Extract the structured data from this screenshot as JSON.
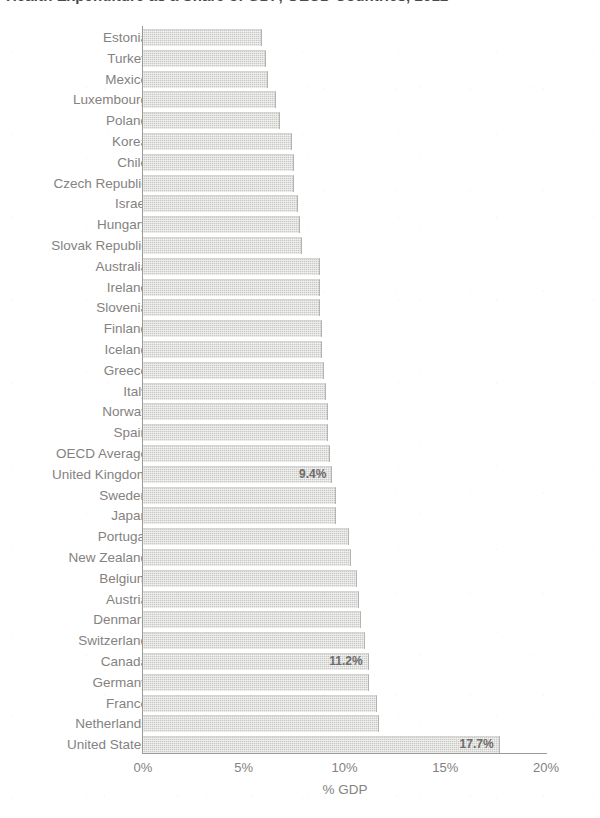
{
  "title": "Health Expenditure as a Share of GDP, OECD Countries, 2012",
  "axis": {
    "xlabel": "% GDP",
    "xticks": [
      "0%",
      "5%",
      "10%",
      "15%",
      "20%"
    ]
  },
  "chart_data": {
    "type": "bar",
    "orientation": "horizontal",
    "title": "Health Expenditure as a Share of GDP, OECD Countries, 2012",
    "xlabel": "% GDP",
    "ylabel": "",
    "xlim": [
      0,
      20
    ],
    "xticks": [
      0,
      5,
      10,
      15,
      20
    ],
    "xtick_labels": [
      "0%",
      "5%",
      "10%",
      "15%",
      "20%"
    ],
    "grid": false,
    "legend": "none",
    "bar_color": "#c9c9c7",
    "categories": [
      "Estonia",
      "Turkey",
      "Mexico",
      "Luxembourg",
      "Poland",
      "Korea",
      "Chile",
      "Czech Republic",
      "Israel",
      "Hungary",
      "Slovak Republic",
      "Australia",
      "Ireland",
      "Slovenia",
      "Finland",
      "Iceland",
      "Greece",
      "Italy",
      "Norway",
      "Spain",
      "OECD Average",
      "United Kingdom",
      "Sweden",
      "Japan",
      "Portugal",
      "New Zealand",
      "Belgium",
      "Austria",
      "Denmark",
      "Switzerland",
      "Canada",
      "Germany",
      "France",
      "Netherlands",
      "United States"
    ],
    "values": [
      5.9,
      6.1,
      6.2,
      6.6,
      6.8,
      7.4,
      7.5,
      7.5,
      7.7,
      7.8,
      7.9,
      8.8,
      8.8,
      8.8,
      8.9,
      8.9,
      9.0,
      9.1,
      9.2,
      9.2,
      9.3,
      9.4,
      9.6,
      9.6,
      10.2,
      10.3,
      10.6,
      10.7,
      10.8,
      11.0,
      11.2,
      11.2,
      11.6,
      11.7,
      17.7
    ],
    "labeled_points": [
      {
        "category": "United Kingdom",
        "label": "9.4%"
      },
      {
        "category": "Canada",
        "label": "11.2%"
      },
      {
        "category": "United States",
        "label": "17.7%"
      }
    ]
  },
  "annotations": {
    "uk_value": "9.4%",
    "canada_value": "11.2%",
    "us_value": "17.7%"
  }
}
